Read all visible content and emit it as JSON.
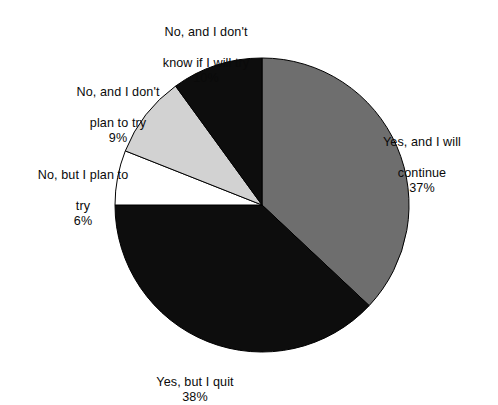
{
  "chart_data": {
    "type": "pie",
    "title": "",
    "subtitle": "",
    "xlabel": "",
    "ylabel": "",
    "legend_position": "none",
    "grid": false,
    "start_angle_deg": 0,
    "direction": "clockwise",
    "categories": [
      "Yes, and I will continue",
      "Yes, but I quit",
      "No, but I plan to try",
      "No, and I don't plan to try",
      "No, and I don't know if I will try"
    ],
    "values": [
      37,
      38,
      6,
      9,
      10
    ],
    "value_unit": "%",
    "slices": [
      {
        "label": "Yes, and I will continue",
        "label_lines": [
          "Yes, and I will",
          "continue"
        ],
        "value": 37,
        "value_text": "37%",
        "color": "#6e6e6e"
      },
      {
        "label": "Yes, but I quit",
        "label_lines": [
          "Yes, but I quit"
        ],
        "value": 38,
        "value_text": "38%",
        "color": "#0d0d0d"
      },
      {
        "label": "No, but I plan to try",
        "label_lines": [
          "No, but I plan to",
          "try"
        ],
        "value": 6,
        "value_text": "6%",
        "color": "#ffffff"
      },
      {
        "label": "No, and I don't plan to try",
        "label_lines": [
          "No, and I don't",
          "plan to try"
        ],
        "value": 9,
        "value_text": "9%",
        "color": "#d2d2d2"
      },
      {
        "label": "No, and I don't know if I will try",
        "label_lines": [
          "No, and I don't",
          "know if I will try"
        ],
        "value": 10,
        "value_text": "10%",
        "color": "#0d0d0d"
      }
    ],
    "geometry": {
      "center_x": 262,
      "center_y": 205,
      "radius": 147
    },
    "outline_color": "#000000",
    "background_color": "#ffffff"
  }
}
